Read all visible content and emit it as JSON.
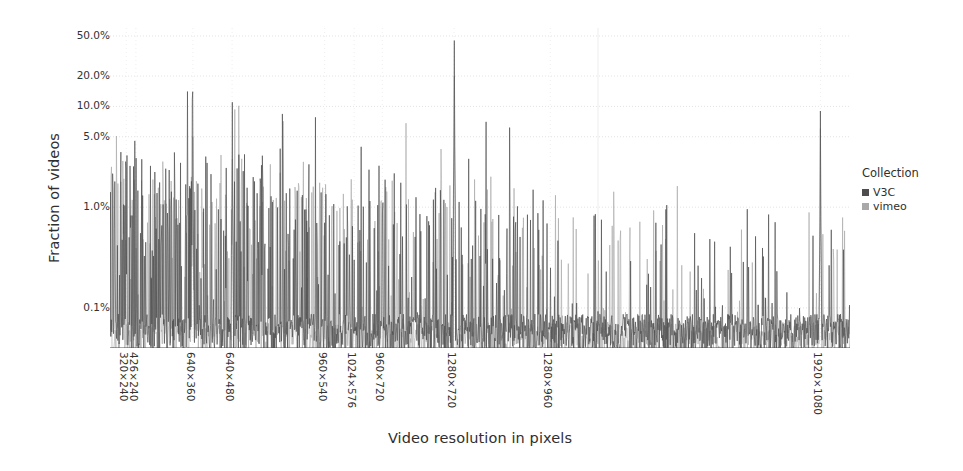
{
  "chart_data": {
    "type": "line",
    "title": "",
    "subtitle": "",
    "xlabel": "Video resolution in pixels",
    "ylabel": "Fraction of videos",
    "yscale": "log",
    "ylim": [
      0.04,
      60
    ],
    "grid": true,
    "legend": {
      "title": "Collection",
      "position": "right",
      "entries": [
        {
          "name": "V3C",
          "color": "#4d4d4d"
        },
        {
          "name": "vimeo",
          "color": "#a8a8a8"
        }
      ]
    },
    "ytick_labels": [
      "50.0%",
      "20.0%",
      "10.0%",
      "5.0%",
      "1.0%",
      "0.1%"
    ],
    "ytick_values": [
      50.0,
      20.0,
      10.0,
      5.0,
      1.0,
      0.1
    ],
    "xtick_labels": [
      "320×240",
      "426×240",
      "640×360",
      "640×480",
      "960×540",
      "1024×576",
      "960×720",
      "1280×720",
      "1280×960",
      "1920×1080"
    ],
    "xtick_positions": [
      0.022,
      0.035,
      0.112,
      0.165,
      0.29,
      0.33,
      0.368,
      0.465,
      0.595,
      0.96
    ],
    "annotations": [],
    "series": [
      {
        "name": "V3C",
        "color": "#4d4d4d",
        "notable_peaks": [
          {
            "label": "320×240",
            "x": 0.022,
            "value": 2.4
          },
          {
            "label": "426×240",
            "x": 0.035,
            "value": 1.1
          },
          {
            "label": "640×360",
            "x": 0.112,
            "value": 14.0
          },
          {
            "label": "640×480",
            "x": 0.165,
            "value": 11.0
          },
          {
            "label": "960×540",
            "x": 0.29,
            "value": 0.7
          },
          {
            "label": "1024×576",
            "x": 0.33,
            "value": 0.3
          },
          {
            "label": "960×720",
            "x": 0.368,
            "value": 0.9
          },
          {
            "label": "1280×720",
            "x": 0.465,
            "value": 45.0
          },
          {
            "label": "1280×960",
            "x": 0.595,
            "value": 0.25
          },
          {
            "label": "1920×1080",
            "x": 0.96,
            "value": 9.0
          }
        ],
        "baseline": 0.06,
        "description": "Dense spiky distribution of V3C video resolutions, most mass below 0.1% with sharp peaks at common resolutions."
      },
      {
        "name": "vimeo",
        "color": "#a8a8a8",
        "notable_peaks": [
          {
            "label": "640×360",
            "x": 0.112,
            "value": 5.0
          },
          {
            "label": "640×480",
            "x": 0.165,
            "value": 3.0
          },
          {
            "label": "1280×720",
            "x": 0.465,
            "value": 20.0
          },
          {
            "label": "1920×1080",
            "x": 0.96,
            "value": 6.0
          }
        ],
        "baseline": 0.05,
        "description": "Lighter-gray overlaid distribution of vimeo video resolutions following a similar spiky pattern."
      }
    ]
  },
  "colors": {
    "axis": "#4a4a4a",
    "grid": "#dcdcdc",
    "text": "#2f2f2f",
    "background": "#ffffff",
    "v3c": "#4d4d4d",
    "vimeo": "#a8a8a8"
  }
}
